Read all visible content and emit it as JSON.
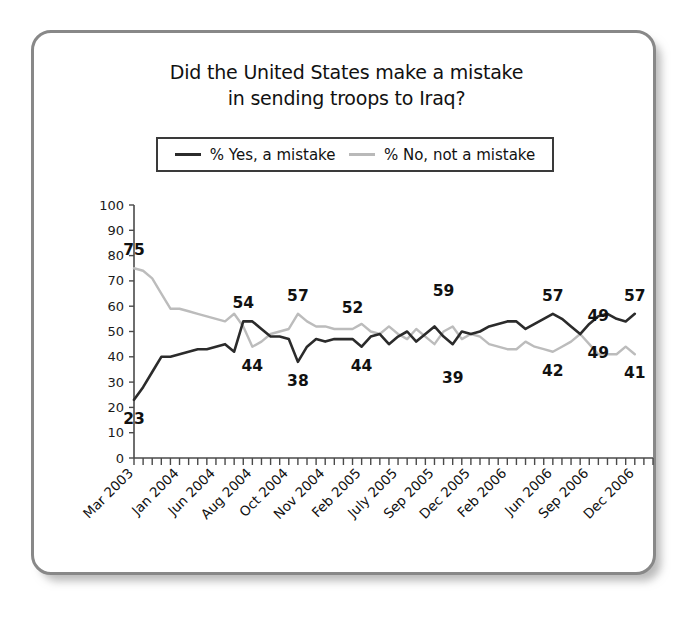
{
  "card": {
    "border_color": "#888888",
    "background": "#ffffff"
  },
  "title": {
    "line1": "Did the United States make a mistake",
    "line2": "in sending troops to Iraq?"
  },
  "legend": {
    "position": "top-center",
    "items": [
      {
        "label": "% Yes, a mistake",
        "color": "#2b2b2b",
        "key": "yes"
      },
      {
        "label": "% No, not a mistake",
        "color": "#bcbcbc",
        "key": "no"
      }
    ]
  },
  "chart_data": {
    "type": "line",
    "title": "Did the United States make a mistake in sending troops to Iraq?",
    "xlabel": "",
    "ylabel": "",
    "ylim": [
      0,
      100
    ],
    "ytick_step": 10,
    "yticks": [
      0,
      10,
      20,
      30,
      40,
      50,
      60,
      70,
      80,
      90,
      100
    ],
    "grid": false,
    "legend_position": "top-center",
    "x_tick_count": 58,
    "xtick_labels": [
      "Mar 2003",
      "Jan 2004",
      "Jun 2004",
      "Aug 2004",
      "Oct 2004",
      "Nov 2004",
      "Feb 2005",
      "July 2005",
      "Sep 2005",
      "Dec 2005",
      "Feb 2006",
      "Jun 2006",
      "Sep 2006",
      "Dec 2006"
    ],
    "xtick_label_indices": [
      0,
      5,
      9,
      13,
      17,
      21,
      25,
      29,
      33,
      37,
      41,
      46,
      50,
      55
    ],
    "series": [
      {
        "name": "% Yes, a mistake",
        "color": "#2b2b2b",
        "values": [
          23,
          28,
          34,
          40,
          40,
          41,
          42,
          43,
          43,
          44,
          45,
          42,
          54,
          54,
          51,
          48,
          48,
          47,
          38,
          44,
          47,
          46,
          47,
          47,
          47,
          44,
          48,
          49,
          45,
          48,
          50,
          46,
          49,
          52,
          48,
          45,
          50,
          49,
          50,
          52,
          53,
          54,
          54,
          51,
          53,
          55,
          57,
          55,
          52,
          49,
          53,
          56,
          57,
          55,
          54,
          57
        ]
      },
      {
        "name": "% No, not a mistake",
        "color": "#bcbcbc",
        "values": [
          75,
          74,
          71,
          65,
          59,
          59,
          58,
          57,
          56,
          55,
          54,
          57,
          52,
          44,
          46,
          49,
          50,
          51,
          57,
          54,
          52,
          52,
          51,
          51,
          51,
          53,
          50,
          49,
          52,
          49,
          47,
          51,
          48,
          45,
          50,
          52,
          47,
          49,
          48,
          45,
          44,
          43,
          43,
          46,
          44,
          43,
          42,
          44,
          46,
          49,
          45,
          41,
          41,
          41,
          44,
          41
        ]
      }
    ],
    "annotations": [
      {
        "text": "75",
        "series": "no",
        "index": 0,
        "value": 75,
        "placement": "above"
      },
      {
        "text": "23",
        "series": "yes",
        "index": 0,
        "value": 23,
        "placement": "below"
      },
      {
        "text": "54",
        "series": "yes",
        "index": 12,
        "value": 54,
        "placement": "above"
      },
      {
        "text": "44",
        "series": "no",
        "index": 13,
        "value": 44,
        "placement": "below"
      },
      {
        "text": "57",
        "series": "no",
        "index": 18,
        "value": 57,
        "placement": "above"
      },
      {
        "text": "38",
        "series": "yes",
        "index": 18,
        "value": 38,
        "placement": "below"
      },
      {
        "text": "52",
        "series": "no",
        "index": 24,
        "value": 52,
        "placement": "above"
      },
      {
        "text": "44",
        "series": "yes",
        "index": 25,
        "value": 44,
        "placement": "below"
      },
      {
        "text": "59",
        "series": "yes",
        "index": 34,
        "value": 59,
        "placement": "above"
      },
      {
        "text": "39",
        "series": "no",
        "index": 35,
        "value": 39,
        "placement": "below"
      },
      {
        "text": "57",
        "series": "yes",
        "index": 46,
        "value": 57,
        "placement": "above"
      },
      {
        "text": "42",
        "series": "no",
        "index": 46,
        "value": 42,
        "placement": "below"
      },
      {
        "text": "49",
        "series": "yes",
        "index": 51,
        "value": 49,
        "placement": "above"
      },
      {
        "text": "49",
        "series": "no",
        "index": 51,
        "value": 49,
        "placement": "below"
      },
      {
        "text": "57",
        "series": "yes",
        "index": 55,
        "value": 57,
        "placement": "above"
      },
      {
        "text": "41",
        "series": "no",
        "index": 55,
        "value": 41,
        "placement": "below"
      }
    ]
  }
}
